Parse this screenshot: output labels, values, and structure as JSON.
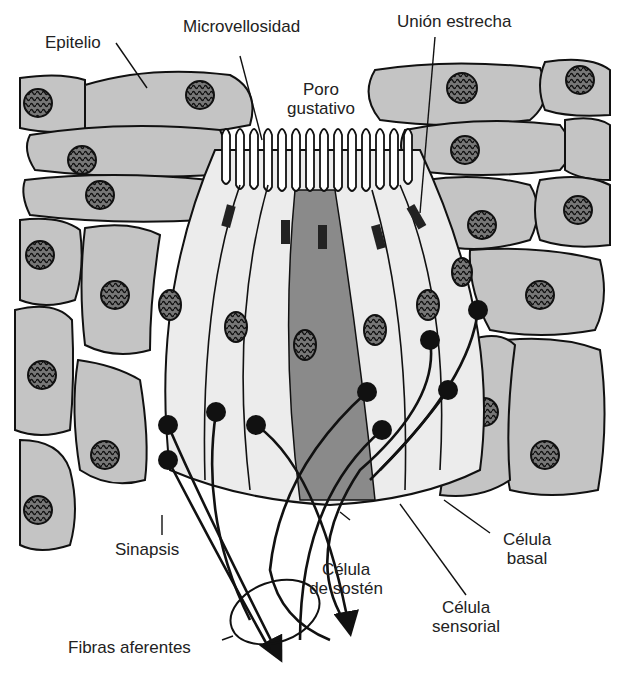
{
  "diagram": {
    "labels": {
      "epitelio": "Epitelio",
      "microvellosidad": "Microvellosidad",
      "union_estrecha": "Unión estrecha",
      "poro_1": "Poro",
      "poro_2": "gustativo",
      "sinapsis": "Sinapsis",
      "sosten_1": "Célula",
      "sosten_2": "de sostén",
      "sensorial_1": "Célula",
      "sensorial_2": "sensorial",
      "basal_1": "Célula",
      "basal_2": "basal",
      "fibras": "Fibras aferentes"
    },
    "colors": {
      "epithelium_fill": "#c4c4c4",
      "bud_fill": "#ececec",
      "support_cell_fill": "#8a8a8a",
      "nucleus_fill": "#6e6e6e",
      "outline": "#111111"
    }
  }
}
